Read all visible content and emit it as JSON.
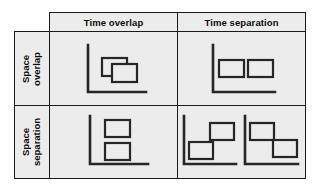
{
  "figure": {
    "type": "2x2-matrix-diagram",
    "background_color": "#ececec",
    "page_color": "#ffffff",
    "line_color": "#262626",
    "border_color": "#1a1a1a",
    "corner_cell_empty": true
  },
  "columns": [
    {
      "id": "time-overlap",
      "label": "Time overlap"
    },
    {
      "id": "time-separation",
      "label": "Time separation"
    }
  ],
  "rows": [
    {
      "id": "space-overlap",
      "label_line1": "Space",
      "label_line2": "overlap"
    },
    {
      "id": "space-separation",
      "label_line1": "Space",
      "label_line2": "separation"
    }
  ],
  "quadrants": {
    "overlap_overlap": {
      "name": "space-overlap-time-overlap",
      "description": "Two overlapping rectangles on a single axis",
      "panels": 1,
      "rectangles": 2
    },
    "overlap_separation": {
      "name": "space-overlap-time-separation",
      "description": "Two side-by-side rectangles at the same height on a single axis",
      "panels": 1,
      "rectangles": 2
    },
    "separation_overlap": {
      "name": "space-separation-time-overlap",
      "description": "Two vertically stacked rectangles on a single axis",
      "panels": 1,
      "rectangles": 2
    },
    "separation_separation": {
      "name": "space-separation-time-separation",
      "description": "Two axis panels, each with two diagonally offset rectangles",
      "panels": 2,
      "rectangles": 4
    }
  }
}
